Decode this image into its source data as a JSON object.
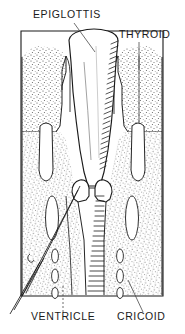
{
  "figure": {
    "name": "coronal-section-of-larynx",
    "style": "black-and-white-line-drawing-with-stipple-shading",
    "background_color": "#ffffff",
    "ink_color": "#1a1a1a",
    "stipple_color": "#4a4a4a",
    "frame": {
      "left": 21,
      "right": 163,
      "top": 30,
      "bottom": 296
    }
  },
  "labels": [
    {
      "id": "epiglottis",
      "text": "EPIGLOTTIS",
      "x": 33,
      "y": 18,
      "anchor": "start",
      "leader": {
        "x1": 74,
        "y1": 23,
        "x2": 95,
        "y2": 52
      }
    },
    {
      "id": "thyroid",
      "text": "THYROID",
      "x": 119,
      "y": 38,
      "anchor": "start",
      "leader": {
        "x1": 139,
        "y1": 42,
        "x2": 139,
        "y2": 70
      }
    },
    {
      "id": "ventricle",
      "text": "VENTRICLE",
      "x": 31,
      "y": 320,
      "anchor": "start",
      "leader": {
        "x1": 63,
        "y1": 312,
        "x2": 63,
        "y2": 285
      }
    },
    {
      "id": "cricoid",
      "text": "CRICOID",
      "x": 117,
      "y": 320,
      "anchor": "start",
      "leader": {
        "x1": 143,
        "y1": 312,
        "x2": 128,
        "y2": 280
      }
    }
  ],
  "structures": [
    {
      "id": "epiglottis-cartilage",
      "label": "epiglottis",
      "region": "upper-midline-dome"
    },
    {
      "id": "thyroid-cartilage-left",
      "label": "thyroid cartilage (left lamina)",
      "region": "upper-left-stippled-block"
    },
    {
      "id": "thyroid-cartilage-right",
      "label": "thyroid cartilage (right lamina)",
      "region": "upper-right-stippled-block"
    },
    {
      "id": "vestibular-fold-left",
      "label": "false cord (left)",
      "region": "mid-left-elongated-oval"
    },
    {
      "id": "vestibular-fold-right",
      "label": "false cord (right)",
      "region": "mid-right-elongated-oval"
    },
    {
      "id": "laryngeal-ventricle-left",
      "label": "ventricle (left)",
      "region": "mid-left-slit"
    },
    {
      "id": "laryngeal-ventricle-right",
      "label": "ventricle (right)",
      "region": "mid-right-slit"
    },
    {
      "id": "vocal-fold-left",
      "label": "true vocal cord (left)",
      "region": "midline-left-bulb"
    },
    {
      "id": "vocal-fold-right",
      "label": "true vocal cord (right)",
      "region": "midline-right-bulb"
    },
    {
      "id": "cricoid-cartilage",
      "label": "cricoid cartilage",
      "region": "lower-stippled-band"
    },
    {
      "id": "tracheal-rings",
      "label": "tracheal rings",
      "region": "lower-small-ovals"
    },
    {
      "id": "airway-lumen",
      "label": "airway lumen",
      "region": "central-white-channel"
    },
    {
      "id": "mucosa-hatching",
      "label": "mucosal lining",
      "region": "central-right-hatched-edge"
    }
  ]
}
